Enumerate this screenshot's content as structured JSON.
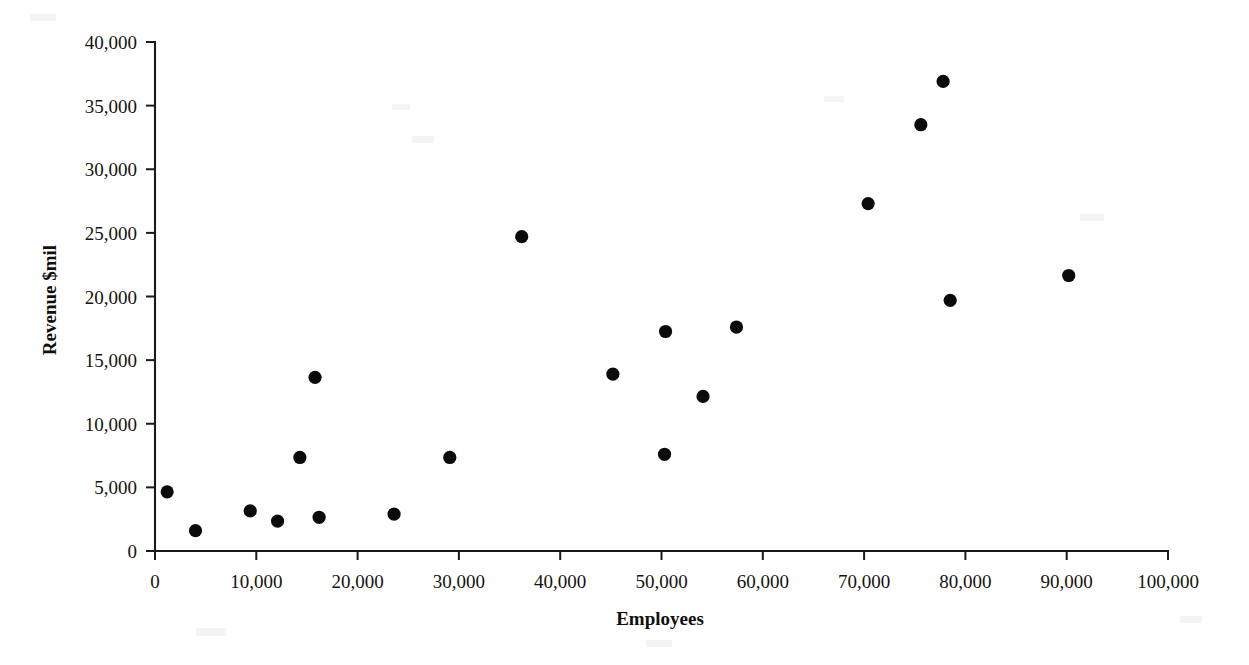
{
  "chart_data": {
    "type": "scatter",
    "title": "",
    "xlabel": "Employees",
    "ylabel": "Revenue $mil",
    "xlim": [
      0,
      100000
    ],
    "ylim": [
      0,
      40000
    ],
    "grid": false,
    "legend": "none",
    "marker": "filled-circle",
    "marker_color": "#000000",
    "xticks": [
      0,
      10000,
      20000,
      30000,
      40000,
      50000,
      60000,
      70000,
      80000,
      90000,
      100000
    ],
    "xtick_labels": [
      "0",
      "10,000",
      "20,000",
      "30,000",
      "40,000",
      "50,000",
      "60,000",
      "70,000",
      "80,000",
      "90,000",
      "100,000"
    ],
    "yticks": [
      0,
      5000,
      10000,
      15000,
      20000,
      25000,
      30000,
      35000,
      40000
    ],
    "ytick_labels": [
      "0",
      "5,000",
      "10,000",
      "15,000",
      "20,000",
      "25,000",
      "30,000",
      "35,000",
      "40,000"
    ],
    "points": [
      {
        "x": 1200,
        "y": 4650
      },
      {
        "x": 4000,
        "y": 1600
      },
      {
        "x": 9400,
        "y": 3150
      },
      {
        "x": 12100,
        "y": 2350
      },
      {
        "x": 14300,
        "y": 7350
      },
      {
        "x": 15800,
        "y": 13650
      },
      {
        "x": 16200,
        "y": 2650
      },
      {
        "x": 23600,
        "y": 2900
      },
      {
        "x": 29100,
        "y": 7350
      },
      {
        "x": 36200,
        "y": 24700
      },
      {
        "x": 45200,
        "y": 13900
      },
      {
        "x": 50300,
        "y": 7600
      },
      {
        "x": 50400,
        "y": 17250
      },
      {
        "x": 54100,
        "y": 12150
      },
      {
        "x": 57400,
        "y": 17600
      },
      {
        "x": 70400,
        "y": 27300
      },
      {
        "x": 75600,
        "y": 33500
      },
      {
        "x": 77800,
        "y": 36900
      },
      {
        "x": 78500,
        "y": 19700
      },
      {
        "x": 90200,
        "y": 21650
      }
    ]
  }
}
